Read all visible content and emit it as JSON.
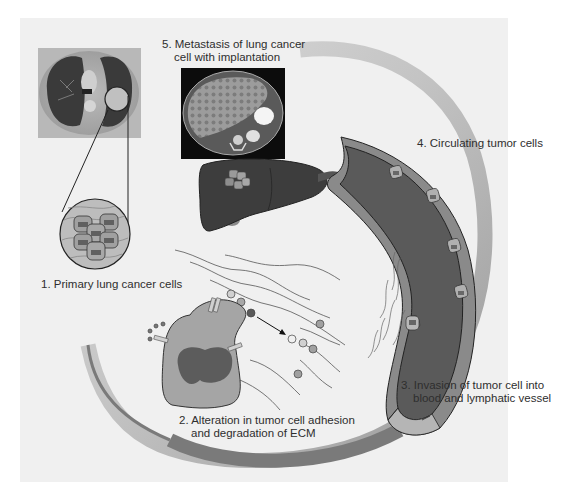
{
  "figure": {
    "panel_background": "#f0f0f0",
    "page_background": "#ffffff",
    "colors": {
      "cycle_arc_light": "#c6c6c6",
      "cycle_arc_dark": "#7a7a7a",
      "vessel_wall": "#8a8a8a",
      "vessel_lumen": "#5a5a5a",
      "vessel_inner_wall": "#b5b5b5",
      "liver": "#3d3d3d",
      "tumor_cell_body": "#a8a8a8",
      "tumor_cell_nucleus": "#5c5c5c",
      "ecm_fiber": "#555555",
      "outline": "#222222"
    }
  },
  "steps": [
    {
      "number": "1.",
      "title": "Primary lung cancer cells",
      "line1": "1. Primary lung cancer cells",
      "line2": ""
    },
    {
      "number": "2.",
      "line1": "2. Alteration in tumor cell adhesion",
      "line2": "and degradation of ECM"
    },
    {
      "number": "3.",
      "line1": "3. Invasion of tumor cell into",
      "line2": "blood and lymphatic vessel"
    },
    {
      "number": "4.",
      "line1": "4. Circulating tumor cells",
      "line2": ""
    },
    {
      "number": "5.",
      "line1": "5. Metastasis of lung cancer",
      "line2": "cell with implantation"
    }
  ],
  "images": {
    "lung_ct": "chest-ct-scan-with-lung-tumor",
    "liver_ct": "abdominal-ct-scan-with-liver-metastases"
  }
}
